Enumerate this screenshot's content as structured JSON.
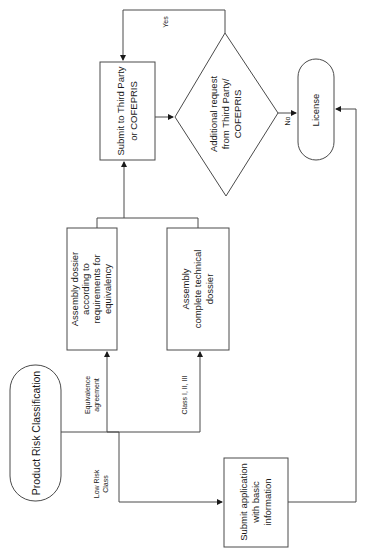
{
  "diagram": {
    "orientation": "rotated 90 degrees counter-clockwise",
    "nodes": {
      "start": {
        "lines": [
          "Product Risk Classification"
        ]
      },
      "equivalence_dossier": {
        "lines": [
          "Assembly dossier",
          "according to",
          "requirements for",
          "equivalency"
        ]
      },
      "technical_dossier": {
        "lines": [
          "Assembly",
          "complete technical",
          "dossier"
        ]
      },
      "submit_third_party": {
        "lines": [
          "Submit to Third Party",
          "or COFEPRIS"
        ]
      },
      "decision": {
        "lines": [
          "Additional request",
          "from Third Party/",
          "COFEPRIS"
        ]
      },
      "license": {
        "lines": [
          "License"
        ]
      },
      "submit_application": {
        "lines": [
          "Submit application",
          "with basic",
          "information"
        ]
      }
    },
    "edge_labels": {
      "equivalence": [
        "Equivalence",
        "agreement"
      ],
      "class": [
        "Class I, II, III"
      ],
      "low_risk": [
        "Low Risk",
        "Class"
      ],
      "yes": [
        "Yes"
      ],
      "no": [
        "No"
      ]
    },
    "colors": {
      "stroke": "#4a4a4a",
      "text": "#1a1a1a",
      "background": "#ffffff"
    }
  }
}
